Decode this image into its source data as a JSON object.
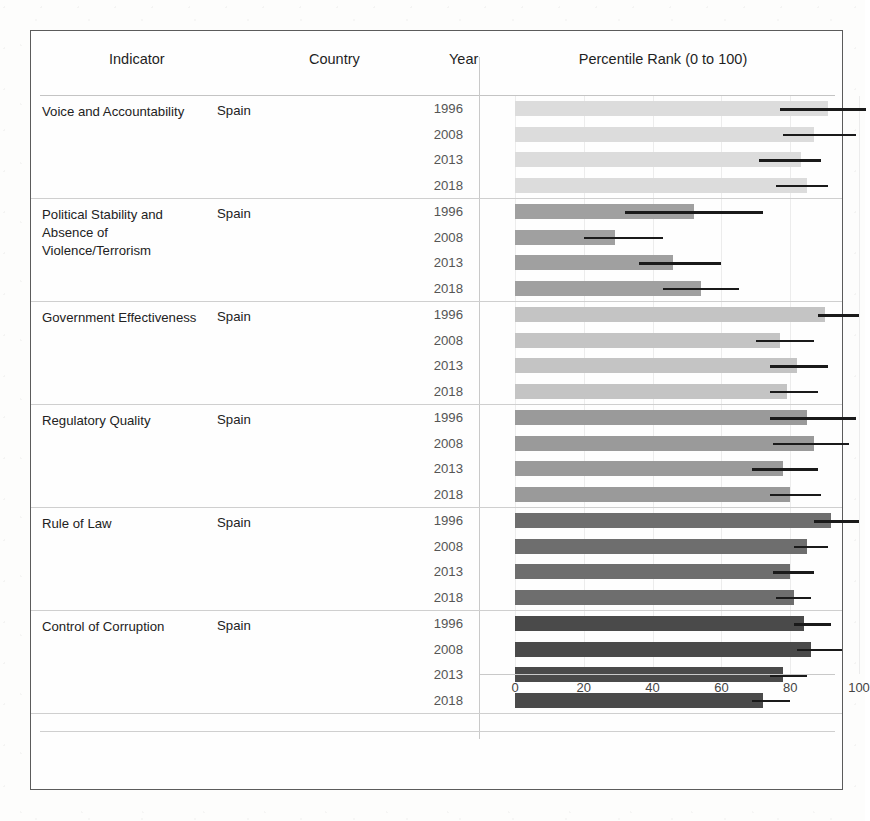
{
  "header": {
    "indicator_label": "Indicator",
    "country_label": "Country",
    "year_label": "Year",
    "chart_label": "Percentile Rank (0 to 100)"
  },
  "axis": {
    "ticks": [
      "0",
      "20",
      "40",
      "60",
      "80",
      "100"
    ],
    "min": 0,
    "max": 100
  },
  "colors": {
    "voice_and_accountability": "#dcdcdc",
    "political_stability": "#a0a0a0",
    "government_effectiveness": "#c4c4c4",
    "regulatory_quality": "#9a9a9a",
    "rule_of_law": "#6e6e6e",
    "control_of_corruption": "#4a4a4a",
    "error_bar": "#1a1a1a",
    "frame": "#5b5b5b",
    "rule": "#cfcfcf"
  },
  "groups": [
    {
      "indicator": "Voice and Accountability",
      "country": "Spain",
      "color": "#dcdcdc",
      "rows": [
        {
          "year": "1996",
          "value": 91,
          "low": 77,
          "high": 102
        },
        {
          "year": "2008",
          "value": 87,
          "low": 78,
          "high": 99
        },
        {
          "year": "2013",
          "value": 83,
          "low": 71,
          "high": 89
        },
        {
          "year": "2018",
          "value": 85,
          "low": 76,
          "high": 91
        }
      ]
    },
    {
      "indicator": "Political Stability and Absence of Violence/Terrorism",
      "country": "Spain",
      "color": "#a0a0a0",
      "rows": [
        {
          "year": "1996",
          "value": 52,
          "low": 32,
          "high": 72
        },
        {
          "year": "2008",
          "value": 29,
          "low": 20,
          "high": 43
        },
        {
          "year": "2013",
          "value": 46,
          "low": 36,
          "high": 60
        },
        {
          "year": "2018",
          "value": 54,
          "low": 43,
          "high": 65
        }
      ]
    },
    {
      "indicator": "Government Effectiveness",
      "country": "Spain",
      "color": "#c4c4c4",
      "rows": [
        {
          "year": "1996",
          "value": 90,
          "low": 88,
          "high": 100
        },
        {
          "year": "2008",
          "value": 77,
          "low": 70,
          "high": 87
        },
        {
          "year": "2013",
          "value": 82,
          "low": 74,
          "high": 91
        },
        {
          "year": "2018",
          "value": 79,
          "low": 74,
          "high": 88
        }
      ]
    },
    {
      "indicator": "Regulatory Quality",
      "country": "Spain",
      "color": "#9a9a9a",
      "rows": [
        {
          "year": "1996",
          "value": 85,
          "low": 74,
          "high": 99
        },
        {
          "year": "2008",
          "value": 87,
          "low": 75,
          "high": 97
        },
        {
          "year": "2013",
          "value": 78,
          "low": 69,
          "high": 88
        },
        {
          "year": "2018",
          "value": 80,
          "low": 74,
          "high": 89
        }
      ]
    },
    {
      "indicator": "Rule of Law",
      "country": "Spain",
      "color": "#6e6e6e",
      "rows": [
        {
          "year": "1996",
          "value": 92,
          "low": 87,
          "high": 100
        },
        {
          "year": "2008",
          "value": 85,
          "low": 81,
          "high": 91
        },
        {
          "year": "2013",
          "value": 80,
          "low": 75,
          "high": 87
        },
        {
          "year": "2018",
          "value": 81,
          "low": 76,
          "high": 86
        }
      ]
    },
    {
      "indicator": "Control of Corruption",
      "country": "Spain",
      "color": "#4a4a4a",
      "rows": [
        {
          "year": "1996",
          "value": 84,
          "low": 81,
          "high": 92
        },
        {
          "year": "2008",
          "value": 86,
          "low": 82,
          "high": 95
        },
        {
          "year": "2013",
          "value": 78,
          "low": 74,
          "high": 85
        },
        {
          "year": "2018",
          "value": 72,
          "low": 69,
          "high": 80
        }
      ]
    }
  ],
  "chart_data": {
    "type": "bar",
    "title": "Percentile Rank (0 to 100)",
    "xlabel": "Percentile Rank (0 to 100)",
    "ylabel": "",
    "xlim": [
      0,
      100
    ],
    "grid": true,
    "legend": "none",
    "orientation": "horizontal",
    "error_bars": true,
    "xticks": [
      0,
      20,
      40,
      60,
      80,
      100
    ],
    "categories": [
      "Voice and Accountability 1996",
      "Voice and Accountability 2008",
      "Voice and Accountability 2013",
      "Voice and Accountability 2018",
      "Political Stability and Absence of Violence/Terrorism 1996",
      "Political Stability and Absence of Violence/Terrorism 2008",
      "Political Stability and Absence of Violence/Terrorism 2013",
      "Political Stability and Absence of Violence/Terrorism 2018",
      "Government Effectiveness 1996",
      "Government Effectiveness 2008",
      "Government Effectiveness 2013",
      "Government Effectiveness 2018",
      "Regulatory Quality 1996",
      "Regulatory Quality 2008",
      "Regulatory Quality 2013",
      "Regulatory Quality 2018",
      "Rule of Law 1996",
      "Rule of Law 2008",
      "Rule of Law 2013",
      "Rule of Law 2018",
      "Control of Corruption 1996",
      "Control of Corruption 2008",
      "Control of Corruption 2013",
      "Control of Corruption 2018"
    ],
    "values": [
      91,
      87,
      83,
      85,
      52,
      29,
      46,
      54,
      90,
      77,
      82,
      79,
      85,
      87,
      78,
      80,
      92,
      85,
      80,
      81,
      84,
      86,
      78,
      72
    ],
    "error_low": [
      77,
      78,
      71,
      76,
      32,
      20,
      36,
      43,
      88,
      70,
      74,
      74,
      74,
      75,
      69,
      74,
      87,
      81,
      75,
      76,
      81,
      82,
      74,
      69
    ],
    "error_high": [
      102,
      99,
      89,
      91,
      72,
      43,
      60,
      65,
      100,
      87,
      91,
      88,
      99,
      97,
      88,
      89,
      100,
      91,
      87,
      86,
      92,
      95,
      85,
      80
    ]
  }
}
